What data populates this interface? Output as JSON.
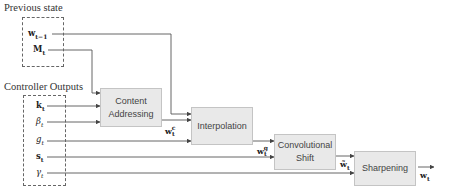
{
  "groups": {
    "previous_state": {
      "title": "Previous state",
      "items": [
        {
          "symbol": "w",
          "sub": "t−1",
          "style": "bold"
        },
        {
          "symbol": "M",
          "sub": "t",
          "style": "bold"
        }
      ]
    },
    "controller_outputs": {
      "title": "Controller Outputs",
      "items": [
        {
          "symbol": "k",
          "sub": "t",
          "style": "bold"
        },
        {
          "symbol": "β",
          "sub": "t",
          "style": "italic"
        },
        {
          "symbol": "g",
          "sub": "t",
          "style": "italic"
        },
        {
          "symbol": "s",
          "sub": "t",
          "style": "bold"
        },
        {
          "symbol": "γ",
          "sub": "t",
          "style": "italic"
        }
      ]
    }
  },
  "blocks": {
    "content_addressing": {
      "line1": "Content",
      "line2": "Addressing"
    },
    "interpolation": {
      "line1": "Interpolation"
    },
    "convolutional_shift": {
      "line1": "Convolutional",
      "line2": "Shift"
    },
    "sharpening": {
      "line1": "Sharpening"
    }
  },
  "edge_labels": {
    "wc": {
      "symbol": "w",
      "sub": "t",
      "sup": "c"
    },
    "wg": {
      "symbol": "w",
      "sub": "t",
      "sup": "g"
    },
    "wtilde": {
      "symbol": "w̃",
      "sub": "t"
    },
    "wout": {
      "symbol": "w",
      "sub": "t"
    }
  },
  "colors": {
    "block_fill": "#e9e9e9",
    "block_border": "#c4c4c4",
    "line": "#555555"
  }
}
